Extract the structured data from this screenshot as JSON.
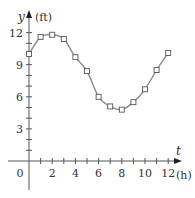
{
  "chart_data": {
    "type": "scatter",
    "title": "",
    "xlabel": "t (h)",
    "ylabel": "y (ft)",
    "x_var": "t",
    "x_unit": "(h)",
    "y_var": "y",
    "y_unit": "(ft)",
    "xlim": [
      0,
      13
    ],
    "ylim": [
      0,
      13
    ],
    "x_ticks": [
      0,
      2,
      4,
      6,
      8,
      10,
      12
    ],
    "x_tick_labels": [
      "0",
      "2",
      "4",
      "6",
      "8",
      "10",
      "12"
    ],
    "y_ticks": [
      3,
      6,
      9,
      12
    ],
    "y_tick_labels": [
      "3",
      "6",
      "9",
      "12"
    ],
    "grid": false,
    "legend": null,
    "series": [
      {
        "name": "data points",
        "marker": "open-square",
        "x": [
          0,
          1,
          2,
          3,
          4,
          5,
          6,
          7,
          8,
          9,
          10,
          11,
          12
        ],
        "y": [
          10.0,
          11.6,
          11.8,
          11.4,
          9.7,
          8.4,
          6.0,
          5.1,
          4.8,
          5.5,
          6.7,
          8.5,
          10.1
        ]
      },
      {
        "name": "sinusoidal fit",
        "style": "line",
        "model": "y = 3.5*sin(0.52*(t - 4.3)) + 8.3, approximate curve through points"
      }
    ],
    "colors": {
      "axis": "#555555",
      "curve": "#8a8a8a",
      "marker": "#555555"
    }
  }
}
